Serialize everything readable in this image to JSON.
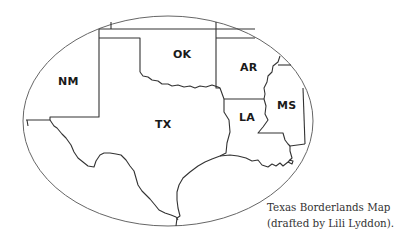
{
  "map": {
    "title": "Texas Borderlands Map",
    "states": [
      {
        "abbr": "NM"
      },
      {
        "abbr": "OK"
      },
      {
        "abbr": "AR"
      },
      {
        "abbr": "TX"
      },
      {
        "abbr": "LA"
      },
      {
        "abbr": "MS"
      }
    ],
    "line_color": "#333333",
    "ellipse_color": "#666666"
  },
  "caption": {
    "line1": "Texas Borderlands Map",
    "line2": "(drafted by Lili Lyddon)."
  }
}
